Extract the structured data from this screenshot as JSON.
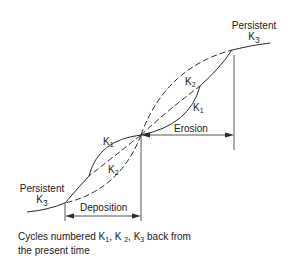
{
  "diagram": {
    "labels": {
      "top_right": {
        "line1": "Persistent",
        "k": "K",
        "sub": "3"
      },
      "bottom_left": {
        "line1": "Persistent",
        "k": "K",
        "sub": "3"
      },
      "upper_k2": {
        "k": "K",
        "sub": "2"
      },
      "upper_k1": {
        "k": "K",
        "sub": "1"
      },
      "lower_k1": {
        "k": "K",
        "sub": "1"
      },
      "lower_k2": {
        "k": "K",
        "sub": "2"
      },
      "erosion": "Erosion",
      "deposition": "Deposition"
    },
    "caption": {
      "prefix": "Cycles numbered K",
      "sub1": "1",
      "sep1": ", K ",
      "sub2": "2",
      "sep2": ", K",
      "sub3": "3",
      "suffix": " back from",
      "line2": "the present time"
    },
    "colors": {
      "line": "#2a2a2a",
      "background": "#ffffff"
    }
  }
}
